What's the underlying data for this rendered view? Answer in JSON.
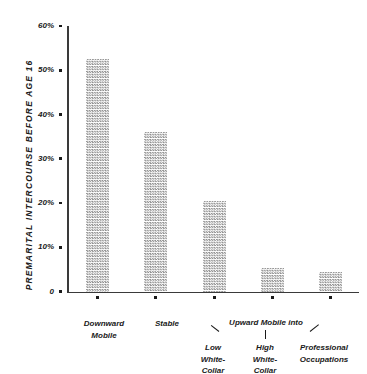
{
  "chart_data": {
    "type": "bar",
    "title": "",
    "xlabel": "",
    "ylabel": "PREMARITAL INTERCOURSE BEFORE AGE 16",
    "ylim": [
      0,
      60
    ],
    "grid": false,
    "legend": null,
    "categories": [
      "Downward Mobile",
      "Stable",
      "Upward Mobile into Low White-Collar",
      "Upward Mobile into High White-Collar",
      "Upward Mobile into Professional Occupations"
    ],
    "values": [
      52.5,
      36,
      20.5,
      5.3,
      4.3
    ],
    "y_ticks": [
      {
        "label": "60%",
        "value": 60
      },
      {
        "label": "50%",
        "value": 50
      },
      {
        "label": "40%",
        "value": 40
      },
      {
        "label": "30%",
        "value": 30
      },
      {
        "label": "20%",
        "value": 20
      },
      {
        "label": "10%",
        "value": 10
      },
      {
        "label": "0",
        "value": 0
      }
    ],
    "x_tick_labels": [
      "Downward\nMobile",
      "Stable",
      "Low\nWhite-\nCollar",
      "High\nWhite-\nCollar",
      "Professional\nOccupations"
    ],
    "group_annotation": "Upward Mobile into",
    "bar_fill_color": "#8f8f8f",
    "axis_color": "#3a3a3a",
    "text_color": "#1a1a1a",
    "background_color": "#ffffff"
  },
  "axis": {
    "y_title": "PREMARITAL INTERCOURSE BEFORE AGE 16"
  }
}
